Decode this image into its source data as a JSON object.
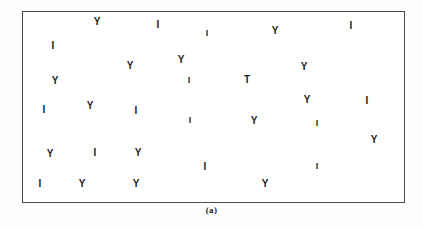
{
  "figure": {
    "caption": "(a)",
    "frame": {
      "x": 22,
      "y": 11,
      "width": 383,
      "height": 192,
      "border_color": "#4a4a4a",
      "background_color": "#ffffff"
    },
    "glyph_color": "#1c1c1c",
    "page_background": "#ffffff"
  },
  "chart_data": {
    "type": "scatter",
    "title": "",
    "subtitle": "",
    "xlabel": "",
    "ylabel": "",
    "grid": false,
    "legend": null,
    "annotations": [
      "(a)"
    ],
    "axis_ticks_visible": false,
    "xlim": [
      22,
      405
    ],
    "ylim": [
      11,
      203
    ],
    "categories": [
      "Y",
      "I",
      "T"
    ],
    "category_counts": {
      "Y": 18,
      "I": 18,
      "T": 1
    },
    "total_points": 37,
    "points": [
      {
        "label": "Y",
        "x": 96,
        "y": 21,
        "size": 10
      },
      {
        "label": "I",
        "x": 157,
        "y": 24,
        "size": 10
      },
      {
        "label": "I",
        "x": 206,
        "y": 32,
        "size": 9
      },
      {
        "label": "Y",
        "x": 274,
        "y": 30,
        "size": 10
      },
      {
        "label": "I",
        "x": 350,
        "y": 25,
        "size": 10
      },
      {
        "label": "I",
        "x": 52,
        "y": 45,
        "size": 10
      },
      {
        "label": "Y",
        "x": 180,
        "y": 59,
        "size": 10
      },
      {
        "label": "Y",
        "x": 129,
        "y": 65,
        "size": 10
      },
      {
        "label": "Y",
        "x": 303,
        "y": 66,
        "size": 10
      },
      {
        "label": "Y",
        "x": 54,
        "y": 80,
        "size": 10
      },
      {
        "label": "I",
        "x": 188,
        "y": 79,
        "size": 9
      },
      {
        "label": "T",
        "x": 246,
        "y": 79,
        "size": 10
      },
      {
        "label": "Y",
        "x": 306,
        "y": 99,
        "size": 10
      },
      {
        "label": "I",
        "x": 366,
        "y": 100,
        "size": 10
      },
      {
        "label": "I",
        "x": 43,
        "y": 109,
        "size": 10
      },
      {
        "label": "Y",
        "x": 89,
        "y": 105,
        "size": 10
      },
      {
        "label": "I",
        "x": 135,
        "y": 110,
        "size": 10
      },
      {
        "label": "I",
        "x": 189,
        "y": 119,
        "size": 9
      },
      {
        "label": "Y",
        "x": 253,
        "y": 120,
        "size": 10
      },
      {
        "label": "I",
        "x": 316,
        "y": 122,
        "size": 9
      },
      {
        "label": "Y",
        "x": 373,
        "y": 139,
        "size": 10
      },
      {
        "label": "Y",
        "x": 49,
        "y": 153,
        "size": 10
      },
      {
        "label": "I",
        "x": 94,
        "y": 152,
        "size": 10
      },
      {
        "label": "Y",
        "x": 137,
        "y": 152,
        "size": 10
      },
      {
        "label": "I",
        "x": 204,
        "y": 166,
        "size": 10
      },
      {
        "label": "I",
        "x": 316,
        "y": 165,
        "size": 9
      },
      {
        "label": "I",
        "x": 39,
        "y": 183,
        "size": 10
      },
      {
        "label": "Y",
        "x": 81,
        "y": 183,
        "size": 10
      },
      {
        "label": "Y",
        "x": 135,
        "y": 183,
        "size": 10
      },
      {
        "label": "Y",
        "x": 264,
        "y": 183,
        "size": 10
      }
    ]
  }
}
